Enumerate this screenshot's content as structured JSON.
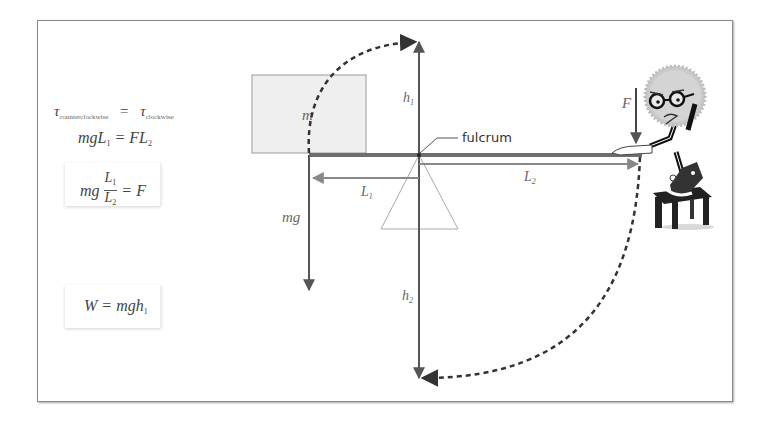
{
  "equations": {
    "torque_balance": {
      "tau": "τ",
      "left_sub": "counterclockwise",
      "equals": "=",
      "right_sub": "clockwise"
    },
    "moment": {
      "lhs": "mgL",
      "lhs_sub": "1",
      "equals": "= FL",
      "rhs_sub": "2"
    },
    "force": {
      "prefix": "mg",
      "num": "L",
      "num_sub": "1",
      "den": "L",
      "den_sub": "2",
      "rhs": "= F"
    },
    "work": {
      "text": "W = mgh",
      "sub": "1"
    }
  },
  "diagram": {
    "mass_label": "m",
    "weight_label": "mg",
    "fulcrum_label": "fulcrum",
    "arm1_label": "L",
    "arm1_sub": "1",
    "arm2_label": "L",
    "arm2_sub": "2",
    "height1_label": "h",
    "height1_sub": "1",
    "height2_label": "h",
    "height2_sub": "2",
    "force_label": "F",
    "character": "cartoon-gear-character-with-glasses-on-stool"
  },
  "colors": {
    "lever": "#6e6e6e",
    "block_fill": "#efefef",
    "block_stroke": "#9a9a9a",
    "arrow": "#555555",
    "dashed_arc": "#333333",
    "fulcrum_triangle": "#aaaaaa"
  }
}
